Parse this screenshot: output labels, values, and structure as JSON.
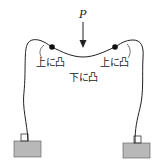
{
  "diagram": {
    "type": "portal frame deformation under point load",
    "load": {
      "label": "P",
      "direction": "down"
    },
    "labels": {
      "left_corner": "上に凸",
      "right_corner": "上に凸",
      "middle": "下に凸"
    },
    "colors": {
      "line": "#222222",
      "support_fill": "#b8b8b8",
      "hinge_dot": "#111111"
    }
  }
}
